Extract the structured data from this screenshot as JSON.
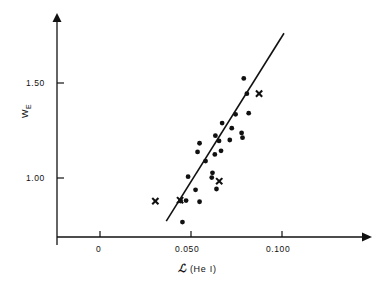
{
  "figure": {
    "background_color": "#ffffff",
    "ink_color": "#111111"
  },
  "axes": {
    "x": {
      "title_symbol": "ℒ",
      "title_rest": " (He I)",
      "title_full": "ℒ (He I)",
      "ticks": [
        {
          "label": "0",
          "value": 0
        },
        {
          "label": "0.050",
          "value": 0.05
        },
        {
          "label": "0.100",
          "value": 0.1
        }
      ],
      "range": [
        -0.009,
        0.146
      ],
      "arrow": true
    },
    "y": {
      "title_main": "W",
      "title_sub": "E",
      "title_full": "W_E",
      "ticks": [
        {
          "label": "1.50",
          "value": 1.5
        },
        {
          "label": "1.00",
          "value": 1.0
        }
      ],
      "range": [
        0.72,
        1.85
      ],
      "arrow": true
    }
  },
  "chart_data": {
    "type": "scatter",
    "title": "",
    "xlabel": "ℒ (He I)",
    "ylabel": "W_E",
    "xlim": [
      -0.009,
      0.146
    ],
    "ylim": [
      0.72,
      1.85
    ],
    "grid": false,
    "legend": false,
    "series": [
      {
        "name": "filled-circles",
        "marker": "circle",
        "color": "#111111",
        "points": [
          {
            "x": 0.0453,
            "y": 0.768
          },
          {
            "x": 0.0443,
            "y": 0.879
          },
          {
            "x": 0.0473,
            "y": 0.881
          },
          {
            "x": 0.0547,
            "y": 0.875
          },
          {
            "x": 0.0525,
            "y": 0.938
          },
          {
            "x": 0.064,
            "y": 0.942
          },
          {
            "x": 0.0484,
            "y": 1.007
          },
          {
            "x": 0.0614,
            "y": 1.002
          },
          {
            "x": 0.0618,
            "y": 1.027
          },
          {
            "x": 0.058,
            "y": 1.089
          },
          {
            "x": 0.0631,
            "y": 1.124
          },
          {
            "x": 0.0536,
            "y": 1.137
          },
          {
            "x": 0.0665,
            "y": 1.143
          },
          {
            "x": 0.0547,
            "y": 1.183
          },
          {
            "x": 0.0654,
            "y": 1.195
          },
          {
            "x": 0.0713,
            "y": 1.2
          },
          {
            "x": 0.0634,
            "y": 1.223
          },
          {
            "x": 0.0783,
            "y": 1.212
          },
          {
            "x": 0.0778,
            "y": 1.237
          },
          {
            "x": 0.0724,
            "y": 1.262
          },
          {
            "x": 0.0671,
            "y": 1.289
          },
          {
            "x": 0.0745,
            "y": 1.335
          },
          {
            "x": 0.0817,
            "y": 1.341
          },
          {
            "x": 0.0807,
            "y": 1.444
          },
          {
            "x": 0.079,
            "y": 1.524
          }
        ]
      },
      {
        "name": "cross-markers",
        "marker": "cross",
        "color": "#111111",
        "points": [
          {
            "x": 0.0304,
            "y": 0.878
          },
          {
            "x": 0.044,
            "y": 0.883
          },
          {
            "x": 0.0655,
            "y": 0.983
          },
          {
            "x": 0.0874,
            "y": 1.444
          }
        ]
      }
    ],
    "fit_line": {
      "name": "regression-line",
      "color": "#111111",
      "x_start": 0.0364,
      "y_start": 0.773,
      "x_end": 0.1011,
      "y_end": 1.762
    }
  }
}
